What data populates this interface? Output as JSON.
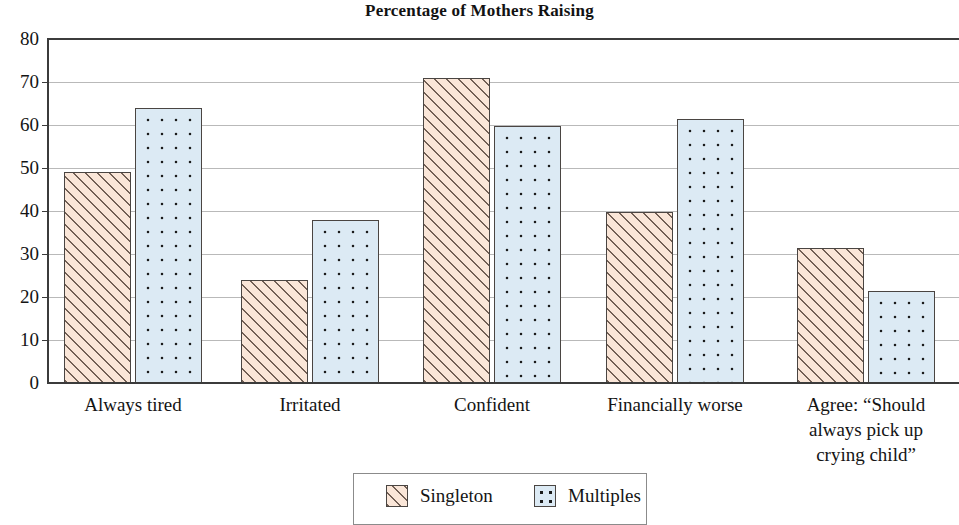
{
  "chart_data": {
    "type": "bar",
    "title": "Percentage of Mothers Raising",
    "xlabel": "",
    "ylabel": "",
    "ylim": [
      0,
      80
    ],
    "ytick_step": 10,
    "yticks": [
      "80",
      "70",
      "60",
      "50",
      "40",
      "30",
      "20",
      "10",
      "0"
    ],
    "grid": true,
    "legend_position": "bottom-center",
    "categories": [
      "Always tired",
      "Irritated",
      "Confident",
      "Financially worse",
      "Agree: “Should always pick up crying child”"
    ],
    "category_label_lines": [
      [
        "Always tired"
      ],
      [
        "Irritated"
      ],
      [
        "Confident"
      ],
      [
        "Financially worse"
      ],
      [
        "Agree: “Should",
        "always pick up",
        "crying child”"
      ]
    ],
    "series": [
      {
        "name": "Singleton",
        "pattern": "diagonal-hatch",
        "fill": "#fae6d8",
        "values": [
          49,
          24,
          71,
          39.8,
          31.5
        ]
      },
      {
        "name": "Multiples",
        "pattern": "dotted",
        "fill": "#dceaf4",
        "values": [
          64,
          38,
          59.8,
          61.5,
          21.5
        ]
      }
    ]
  },
  "legend": {
    "items": [
      {
        "label": "Singleton"
      },
      {
        "label": "Multiples"
      }
    ]
  }
}
